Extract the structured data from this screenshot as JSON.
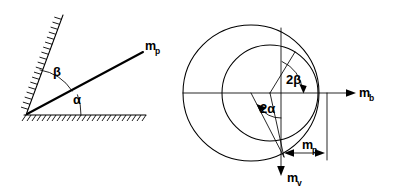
{
  "figure": {
    "background_color": "#ffffff",
    "line_color": "#000000",
    "panels": [
      {
        "id": "left-panel",
        "name": "wedge-geometry-panel",
        "description": "Inclined wall and horizontal ground with vector m_p",
        "labels": [
          {
            "id": "alpha",
            "text": "α",
            "x": 73,
            "y": 104
          },
          {
            "id": "beta",
            "text": "β",
            "x": 58,
            "y": 76
          },
          {
            "id": "mp",
            "text": "m",
            "sub": "p",
            "x": 146,
            "y": 50
          }
        ]
      },
      {
        "id": "right-panel",
        "name": "mohr-circle-panel",
        "description": "Two circles with angle markers 2alpha and 2beta, axes m_b and m_v, and dimension m_p",
        "labels": [
          {
            "id": "two-beta",
            "text": "2β",
            "x": 286,
            "y": 84
          },
          {
            "id": "two-alpha",
            "text": "2α",
            "x": 261,
            "y": 113
          },
          {
            "id": "mb",
            "text": "m",
            "sub": "b",
            "x": 359,
            "y": 97
          },
          {
            "id": "mv",
            "text": "m",
            "sub": "v",
            "x": 289,
            "y": 182
          },
          {
            "id": "mp-dim",
            "text": "m",
            "sub": "p",
            "x": 303,
            "y": 150
          }
        ]
      }
    ],
    "symbols": {
      "alpha": "α",
      "beta": "β",
      "two_alpha": "2α",
      "two_beta": "2β",
      "m_base": "m",
      "sub_p": "p",
      "sub_b": "b",
      "sub_v": "v"
    }
  }
}
